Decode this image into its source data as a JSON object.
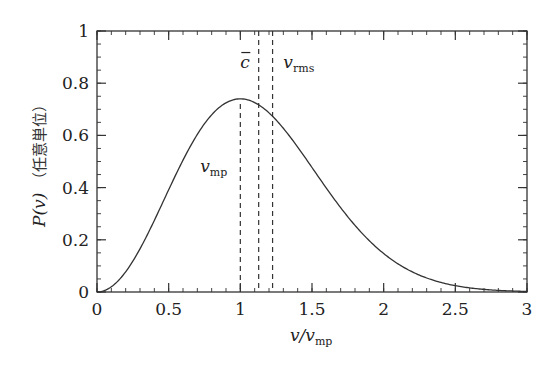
{
  "chart_data": {
    "type": "line",
    "title": "",
    "xlabel": "v/v_mp",
    "ylabel": "P(v)（任意単位）",
    "xlim": [
      0,
      3
    ],
    "ylim": [
      0,
      1
    ],
    "x_ticks": [
      "0",
      "0.5",
      "1",
      "1.5",
      "2",
      "2.5",
      "3"
    ],
    "x_tick_values": [
      0,
      0.5,
      1,
      1.5,
      2,
      2.5,
      3
    ],
    "y_ticks": [
      "0",
      "0.2",
      "0.4",
      "0.6",
      "0.8",
      "1"
    ],
    "y_tick_values": [
      0,
      0.2,
      0.4,
      0.6,
      0.8,
      1
    ],
    "x_minor_step": 0.1,
    "y_minor_step": 0.05,
    "grid": false,
    "legend": null,
    "series": [
      {
        "name": "Maxwell speed distribution P(v)",
        "style": "solid",
        "color": "#333333",
        "x": [
          0,
          0.1,
          0.2,
          0.3,
          0.4,
          0.5,
          0.6,
          0.7,
          0.8,
          0.9,
          1.0,
          1.1,
          1.2,
          1.3,
          1.4,
          1.5,
          1.6,
          1.7,
          1.8,
          1.9,
          2.0,
          2.1,
          2.2,
          2.3,
          2.4,
          2.5,
          2.6,
          2.7,
          2.8,
          2.9,
          3.0
        ],
        "values": [
          0,
          0.02,
          0.077,
          0.166,
          0.276,
          0.395,
          0.512,
          0.613,
          0.688,
          0.732,
          0.74,
          0.713,
          0.654,
          0.57,
          0.47,
          0.366,
          0.271,
          0.19,
          0.126,
          0.079,
          0.047,
          0.027,
          0.014,
          0.007,
          0.003,
          0.0015,
          0.0007,
          0.0003,
          0.0001,
          4e-05,
          2e-05
        ]
      }
    ],
    "peak_value": 0.74,
    "annotations": [
      {
        "label": "v_mp",
        "main": "v",
        "sub": "mp",
        "x": 1.0,
        "line": "dashed",
        "from_y": 0.72,
        "to_y": 0,
        "label_pos": [
          0.72,
          0.46
        ]
      },
      {
        "label": "c̄",
        "main": "c",
        "sub": "",
        "overbar": true,
        "x": 1.128,
        "line": "dashed",
        "from_y": 1,
        "to_y": 0,
        "label_pos": [
          1.0,
          0.86
        ]
      },
      {
        "label": "v_rms",
        "main": "v",
        "sub": "rms",
        "x": 1.225,
        "line": "dashed",
        "from_y": 1,
        "to_y": 0,
        "label_pos": [
          1.3,
          0.86
        ]
      }
    ]
  },
  "axes": {
    "xlabel_main": "v/v",
    "xlabel_sub": "mp",
    "ylabel_math": "P(v)",
    "ylabel_cjk": "（任意単位）"
  }
}
